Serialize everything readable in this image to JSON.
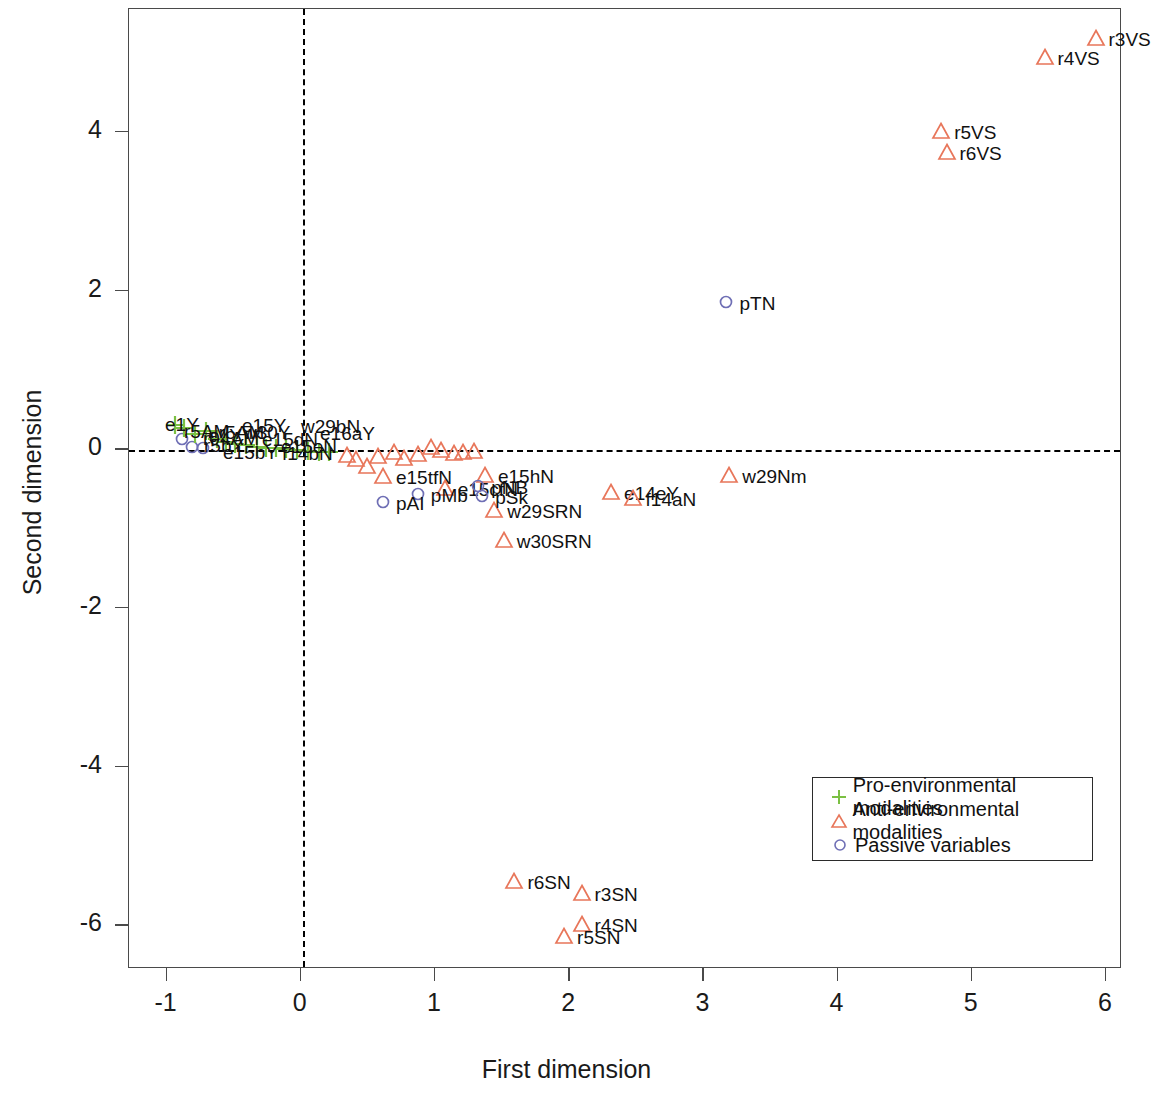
{
  "chart_data": {
    "type": "scatter",
    "title": "",
    "xlabel": "First dimension",
    "ylabel": "Second dimension",
    "xlim": [
      -1.28,
      6.12
    ],
    "ylim": [
      -6.55,
      5.55
    ],
    "xticks": [
      -1,
      0,
      1,
      2,
      3,
      4,
      5,
      6
    ],
    "xticklabels": [
      "-1",
      "0",
      "1",
      "2",
      "3",
      "4",
      "5",
      "6"
    ],
    "yticks": [
      4,
      2,
      0,
      -2,
      -4,
      -6
    ],
    "yticklabels": [
      "4",
      "2",
      "0",
      "-2",
      "-4",
      "-6"
    ],
    "grid": false,
    "reference_lines": [
      {
        "axis": "horizontal",
        "value": 0,
        "style": "dashed",
        "color": "#000000"
      },
      {
        "axis": "vertical",
        "value": 0,
        "style": "dashed",
        "color": "#000000"
      }
    ],
    "legend": {
      "position": "bottom-right",
      "entries": [
        {
          "label": "Pro-environmental modalities",
          "symbol": "plus",
          "color": "#7bc043"
        },
        {
          "label": "Anti-environmental modalities",
          "symbol": "triangle",
          "color": "#e8765a"
        },
        {
          "label": "Passive variables",
          "symbol": "circle",
          "color": "#6f6fb5"
        }
      ]
    },
    "series": [
      {
        "name": "Anti-environmental modalities",
        "symbol": "triangle",
        "color": "#e8765a",
        "points": [
          {
            "x": 5.93,
            "y": 5.17,
            "label": "r3VS"
          },
          {
            "x": 5.55,
            "y": 4.93,
            "label": "r4VS"
          },
          {
            "x": 4.78,
            "y": 4.0,
            "label": "r5VS"
          },
          {
            "x": 4.82,
            "y": 3.74,
            "label": "r6VS"
          },
          {
            "x": 3.2,
            "y": -0.33,
            "label": "w29Nm"
          },
          {
            "x": 2.32,
            "y": -0.55,
            "label": "e14eY"
          },
          {
            "x": 2.48,
            "y": -0.62,
            "label": "f14aN"
          },
          {
            "x": 1.38,
            "y": -0.33,
            "label": "e15hN"
          },
          {
            "x": 1.08,
            "y": -0.5,
            "label": "e15cfN"
          },
          {
            "x": 0.62,
            "y": -0.35,
            "label": "e15tfN"
          },
          {
            "x": 1.45,
            "y": -0.78,
            "label": "w29SRN"
          },
          {
            "x": 1.52,
            "y": -1.15,
            "label": "w30SRN"
          },
          {
            "x": 1.6,
            "y": -5.45,
            "label": "r6SN"
          },
          {
            "x": 2.1,
            "y": -5.6,
            "label": "r3SN"
          },
          {
            "x": 2.1,
            "y": -6.0,
            "label": "r4SN"
          },
          {
            "x": 1.97,
            "y": -6.15,
            "label": "r5SN"
          },
          {
            "x": 0.5,
            "y": -0.22
          },
          {
            "x": 0.58,
            "y": -0.1
          },
          {
            "x": 0.7,
            "y": -0.05
          },
          {
            "x": 0.78,
            "y": -0.12
          },
          {
            "x": 0.88,
            "y": -0.07
          },
          {
            "x": 0.98,
            "y": 0.02
          },
          {
            "x": 1.05,
            "y": -0.02
          },
          {
            "x": 1.15,
            "y": -0.06
          },
          {
            "x": 1.22,
            "y": -0.05
          },
          {
            "x": 1.3,
            "y": -0.03
          },
          {
            "x": 0.42,
            "y": -0.14
          },
          {
            "x": 0.35,
            "y": -0.08
          }
        ]
      },
      {
        "name": "Passive variables",
        "symbol": "circle",
        "color": "#6f6fb5",
        "points": [
          {
            "x": 3.18,
            "y": 1.85,
            "label": "pTN"
          },
          {
            "x": 1.33,
            "y": -0.47,
            "label": "pNB"
          },
          {
            "x": 1.36,
            "y": -0.6,
            "label": "pSk"
          },
          {
            "x": 0.88,
            "y": -0.58,
            "label": "pMb"
          },
          {
            "x": 0.62,
            "y": -0.68,
            "label": "pAI"
          },
          {
            "x": -0.88,
            "y": 0.12
          },
          {
            "x": -0.8,
            "y": 0.02
          },
          {
            "x": -0.72,
            "y": 0.0
          }
        ]
      },
      {
        "name": "Pro-environmental modalities",
        "symbol": "plus",
        "color": "#7bc043",
        "points": [
          {
            "x": -0.93,
            "y": 0.3
          },
          {
            "x": -0.86,
            "y": 0.26
          },
          {
            "x": -0.78,
            "y": 0.18,
            "label": "e1Y"
          },
          {
            "x": -0.7,
            "y": 0.22,
            "label": "r5AM"
          },
          {
            "x": -0.62,
            "y": 0.12
          },
          {
            "x": -0.55,
            "y": 0.08
          },
          {
            "x": -0.48,
            "y": 0.06
          },
          {
            "x": -0.4,
            "y": 0.04
          },
          {
            "x": -0.32,
            "y": 0.02
          },
          {
            "x": -0.25,
            "y": 0.01
          },
          {
            "x": -0.18,
            "y": 0.0
          },
          {
            "x": -0.1,
            "y": -0.01
          },
          {
            "x": -0.02,
            "y": -0.02
          },
          {
            "x": 0.06,
            "y": -0.03
          },
          {
            "x": 0.14,
            "y": -0.04
          },
          {
            "x": 0.22,
            "y": -0.05
          }
        ]
      }
    ],
    "cluster_labels_near_origin": [
      "e1Y",
      "r5AM",
      "r04AM",
      "r5bY",
      "e15bY",
      "e15Y",
      "w30Y",
      "e15dN",
      "e15eN",
      "f14bN",
      "w29bN",
      "e16aY"
    ]
  }
}
